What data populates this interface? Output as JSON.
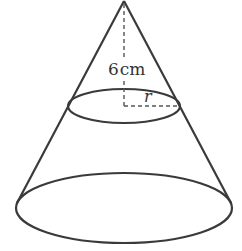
{
  "diagram": {
    "type": "cone",
    "labels": {
      "height": "6cm",
      "height_number": "6",
      "height_unit": "cm",
      "radius": "r"
    },
    "colors": {
      "stroke": "#3a3a3a",
      "background": "#ffffff"
    }
  }
}
